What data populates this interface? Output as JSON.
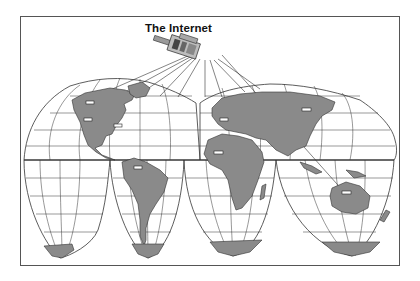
{
  "figure": {
    "title": "The Internet",
    "projection": "interrupted Goode homolosine"
  },
  "colors": {
    "land": "#8a8a8a",
    "land_stroke": "#333333",
    "grid": "#333333",
    "frame": "#555555",
    "background": "#ffffff"
  },
  "icons": {
    "satellite": "satellite-icon",
    "node": "network-node-icon"
  },
  "map": {
    "lobes": [
      {
        "name": "north-america-pacific",
        "region": "North America"
      },
      {
        "name": "south-america",
        "region": "South America"
      },
      {
        "name": "europe-africa",
        "region": "Europe / Africa"
      },
      {
        "name": "asia-australia",
        "region": "Asia / Australia"
      }
    ],
    "nodes": [
      {
        "name": "node-canada",
        "x": 87,
        "y": 101
      },
      {
        "name": "node-usa-west",
        "x": 84,
        "y": 118
      },
      {
        "name": "node-usa-east",
        "x": 118,
        "y": 124
      },
      {
        "name": "node-south-america",
        "x": 137,
        "y": 166
      },
      {
        "name": "node-europe",
        "x": 222,
        "y": 120
      },
      {
        "name": "node-africa",
        "x": 218,
        "y": 153
      },
      {
        "name": "node-russia",
        "x": 306,
        "y": 110
      },
      {
        "name": "node-australia",
        "x": 345,
        "y": 193
      }
    ]
  }
}
